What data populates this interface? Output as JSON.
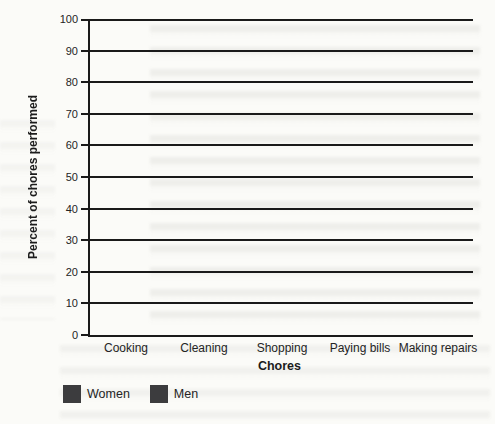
{
  "figure": {
    "y_axis_title": "Percent of chores performed",
    "x_axis_title": "Chores"
  },
  "chart_data": {
    "type": "bar",
    "title": "",
    "categories": [
      "Cooking",
      "Cleaning",
      "Shopping",
      "Paying bills",
      "Making repairs"
    ],
    "series": [
      {
        "name": "Women",
        "values": [
          81,
          78,
          87,
          63,
          14
        ]
      },
      {
        "name": "Men",
        "values": [
          15,
          6,
          12,
          35,
          91
        ]
      }
    ],
    "xlabel": "Chores",
    "ylabel": "Percent of chores performed",
    "ylim": [
      0,
      100
    ],
    "yticks": [
      100,
      90,
      80,
      70,
      60,
      50,
      40,
      30,
      20,
      10,
      0
    ],
    "grid": true,
    "legend_position": "bottom-left",
    "bar_color": "#3c3c3e"
  },
  "colors": {
    "bar": "#3c3c3e",
    "axis": "#1a1a1a",
    "paper": "#fbfbf8"
  }
}
